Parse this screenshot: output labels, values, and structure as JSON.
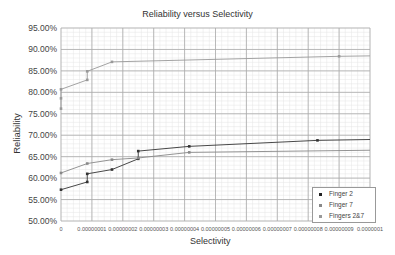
{
  "chart_data": {
    "type": "line",
    "title": "Reliability versus Selectivity",
    "xlabel": "Selectivity",
    "ylabel": "Reliability",
    "xlim": [
      0,
      1e-07
    ],
    "ylim": [
      0.5,
      0.95
    ],
    "grid": true,
    "legend_position": "lower right",
    "x_ticks": [
      "0",
      "0.00000001",
      "0.00000002",
      "0.00000003",
      "0.00000004",
      "0.00000005",
      "0.00000006",
      "0.00000007",
      "0.00000008",
      "0.00000009",
      "0.0000001"
    ],
    "y_ticks": [
      "50.00%",
      "55.00%",
      "60.00%",
      "65.00%",
      "70.00%",
      "75.00%",
      "80.00%",
      "85.00%",
      "90.00%",
      "95.00%"
    ],
    "series": [
      {
        "name": "Finger 2",
        "color": "#333333",
        "x": [
          0,
          8.5e-09,
          8.5e-09,
          1.65e-08,
          2.5e-08,
          2.5e-08,
          4.15e-08,
          8.3e-08,
          1e-07
        ],
        "y": [
          0.573,
          0.591,
          0.61,
          0.62,
          0.645,
          0.663,
          0.674,
          0.688,
          0.69
        ]
      },
      {
        "name": "Finger 7",
        "color": "#888888",
        "x": [
          0,
          8.5e-09,
          1.65e-08,
          2.5e-08,
          4.15e-08,
          1e-07
        ],
        "y": [
          0.612,
          0.634,
          0.643,
          0.647,
          0.66,
          0.665
        ]
      },
      {
        "name": "Fingers 2&7",
        "color": "#999999",
        "x": [
          0,
          0,
          0,
          8.5e-09,
          8.5e-09,
          1.65e-08,
          9e-08,
          1e-07
        ],
        "y": [
          0.762,
          0.786,
          0.807,
          0.829,
          0.849,
          0.871,
          0.884,
          0.885
        ]
      }
    ]
  },
  "legend": {
    "items": [
      {
        "label": "Finger 2"
      },
      {
        "label": "Finger 7"
      },
      {
        "label": "Fingers 2&7"
      }
    ]
  }
}
